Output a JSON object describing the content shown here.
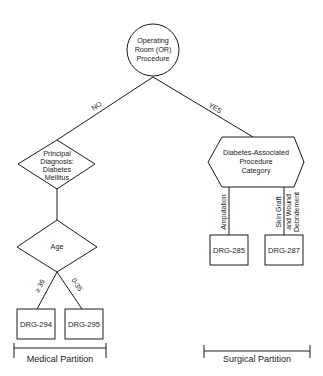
{
  "diagram": {
    "type": "decision-tree",
    "root": {
      "shape": "circle",
      "lines": [
        "Operating",
        "Room (OR)",
        "Procedure"
      ]
    },
    "edges": {
      "no": "NO",
      "yes": "YES"
    },
    "medical": {
      "diagnosis_node": {
        "shape": "diamond",
        "lines": [
          "Principal",
          "Diagnosis:",
          "Diabetes",
          "Mellitus"
        ]
      },
      "age_node": {
        "shape": "diamond",
        "label": "Age"
      },
      "age_branches": {
        "left": "≥ 36",
        "right": "0-35"
      },
      "outcomes": [
        "DRG-294",
        "DRG-295"
      ],
      "partition_label": "Medical Partition"
    },
    "surgical": {
      "category_node": {
        "shape": "hexagon",
        "lines": [
          "Diabetes-Associated",
          "Procedure",
          "Category"
        ]
      },
      "branches": {
        "left": "Amputation",
        "right_line1": "Skin Graft",
        "right_line2": "and Wound",
        "right_line3": "Debridement"
      },
      "outcomes": [
        "DRG-285",
        "DRG-287"
      ],
      "partition_label": "Surgical Partition"
    }
  }
}
